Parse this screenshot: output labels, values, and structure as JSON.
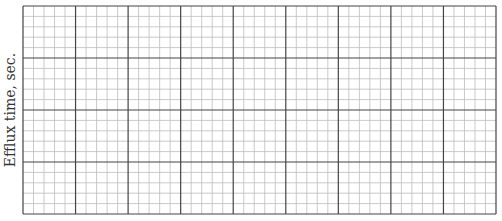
{
  "chart_data": {
    "type": "line",
    "title": "",
    "xlabel": "",
    "ylabel": "Efflux time, sec.",
    "series": [],
    "grid": true,
    "grid_layout": {
      "major_columns": 9,
      "major_rows": 4,
      "minor_per_major": 5
    },
    "legend": null
  },
  "colors": {
    "minor_line": "#bdbdbd",
    "major_line": "#444444",
    "label": "#333333"
  }
}
